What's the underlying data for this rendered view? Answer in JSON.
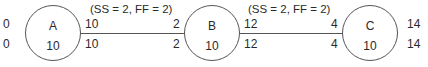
{
  "nodes": [
    {
      "id": "A",
      "duration": "10",
      "es": "0",
      "ef": "10",
      "ls": "0",
      "lf": "10"
    },
    {
      "id": "B",
      "duration": "10",
      "es": "2",
      "ef": "12",
      "ls": "2",
      "lf": "12"
    },
    {
      "id": "C",
      "duration": "10",
      "es": "4",
      "ef": "14",
      "ls": "4",
      "lf": "14"
    }
  ],
  "links": [
    {
      "from": "A",
      "to": "B",
      "label": "(SS = 2, FF = 2)"
    },
    {
      "from": "B",
      "to": "C",
      "label": "(SS = 2, FF = 2)"
    }
  ]
}
